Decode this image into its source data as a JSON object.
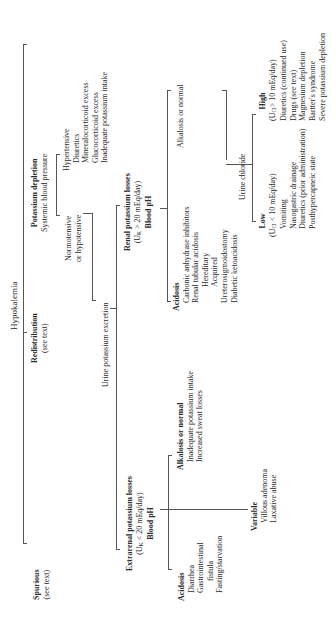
{
  "title": "Hypokalemia",
  "nodes": {
    "spurious": {
      "label": "Spurious",
      "note": "(see text)"
    },
    "redistribution": {
      "label": "Redistribution",
      "note": "(see text)"
    },
    "potassium_depletion": {
      "label": "Potassium depletion",
      "note": "Systemic blood pressure"
    },
    "hypertensive": {
      "label": "Hypertensive",
      "items": [
        "Diuretics",
        "Mineralocorticoid excess",
        "Glucocorticoid excess",
        "Inadequate potassium intake"
      ]
    },
    "normotensive": {
      "line1": "Normotensive",
      "line2": "or hypotensive"
    },
    "urine_potassium": {
      "label": "Urine potassium excretion"
    },
    "extrarenal": {
      "label": "Extrarenal potassium losses",
      "cond_pre": "(U",
      "cond_sub": "K",
      "cond_post": " < 20 mEq/day)",
      "next": "Blood pH"
    },
    "renal": {
      "label": "Renal potassium losses",
      "cond_pre": "(U",
      "cond_sub": "K",
      "cond_post": " > 20 mEq/day)",
      "next": "Blood pH"
    },
    "extrarenal_acidosis": {
      "label": "Acidosis",
      "items": [
        "Diarrhea",
        "Gastrointestinal",
        "fistula",
        "Fasting/starvation"
      ]
    },
    "extrarenal_alkalosis": {
      "label": "Alkalosis or normal",
      "items": [
        "Inadequate potassium intake",
        "Increased sweat losses"
      ]
    },
    "extrarenal_variable": {
      "label": "Variable",
      "items": [
        "Villous adenoma",
        "Laxative abuse"
      ]
    },
    "renal_acidosis": {
      "label": "Acidosis",
      "items": [
        "Carbonic anhydrase inhibitors",
        "Renal tubular acidosis",
        "Hereditary",
        "Acquired",
        "Ureterosigmoidostomy",
        "Diabetic ketoacidosis"
      ]
    },
    "renal_alkalosis": {
      "label": "Alkalosis or normal"
    },
    "urine_chloride": {
      "label": "Urine chloride"
    },
    "low": {
      "label": "Low",
      "cond_pre": "(U",
      "cond_sub": "Cl",
      "cond_post": " < 10 mEq/day)",
      "items": [
        "Vomiting",
        "Nasogastric drainage",
        "Diuretics (prior administration)",
        "Posthypercapneic state"
      ]
    },
    "high": {
      "label": "High",
      "cond_pre": "(U",
      "cond_sub": "Cl",
      "cond_post": "> 10 mEq/day)",
      "items": [
        "Diuretics (continued use)",
        "Drugs (see text)",
        "Magnesium depletion",
        "Bartter's syndrome",
        "Severe potassium depletion"
      ]
    }
  }
}
